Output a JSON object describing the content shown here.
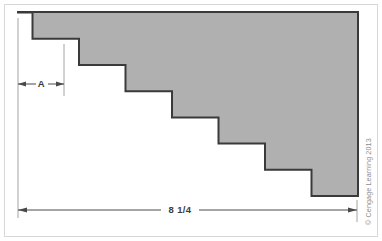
{
  "figure": {
    "name": "stepped-block-dimension-drawing",
    "frame_color": "#d8d8d8",
    "background_color": "#ffffff"
  },
  "shape": {
    "name": "stepped-solid",
    "fill_color": "#b0b0b0",
    "outline_color": "#3a3a3a",
    "step_count": 7,
    "step_width_px": 46.5,
    "step_height_px": 26.2,
    "origin_x_px": 18,
    "origin_y_px": 12,
    "right_edge_x_px": 358,
    "bottom_edge_y_px": 196
  },
  "dimensions": {
    "step_width": {
      "label": "A",
      "line_y_px": 84,
      "start_x_px": 18,
      "end_x_px": 64,
      "arrow_style": "double-arrow-inside"
    },
    "overall_width": {
      "label": "8 1/4",
      "line_y_px": 210,
      "start_x_px": 18,
      "end_x_px": 357,
      "arrow_style": "double-arrow-inside"
    }
  },
  "extension_lines": {
    "color": "#9a9a9a",
    "left_x_px": 18,
    "first_step_x_px": 64,
    "right_x_px": 357
  },
  "credit": {
    "text": "© Cengage Learning 2013",
    "color": "#8c8c8c",
    "rotation_deg": -90
  }
}
